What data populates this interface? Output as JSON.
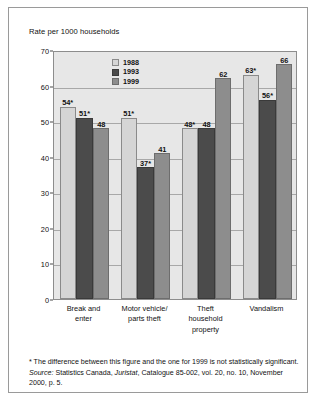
{
  "figure": {
    "axis_title": "Rate per 1000 households",
    "footnote": "* The difference between this figure and the one for 1999 is not statistically significant.",
    "source_prefix": "Source:",
    "source_text": " Statistics Canada, ",
    "source_italic_mid": "Juristat",
    "source_rest": ", Catalogue 85-002, vol. 20, no. 10, November 2000, p. 5."
  },
  "colors": {
    "s1988": "#d5d5d5",
    "s1993": "#4b4b4b",
    "s1999": "#8d8d8d",
    "plot_bg": "#e7e7e7",
    "grid": "#a8a8a8",
    "frame": "#9a9a9a"
  },
  "chart_data": {
    "type": "bar",
    "title": "",
    "xlabel": "",
    "ylabel": "Rate per 1000 households",
    "ylim": [
      0,
      70
    ],
    "yticks": [
      0,
      10,
      20,
      30,
      40,
      50,
      60,
      70
    ],
    "grid": true,
    "legend_position": "top-center",
    "categories": [
      "Break and enter",
      "Motor vehicle/ parts theft",
      "Theft household property",
      "Vandalism"
    ],
    "category_lines": [
      [
        "Break and",
        "enter"
      ],
      [
        "Motor vehicle/",
        "parts theft"
      ],
      [
        "Theft",
        "household",
        "property"
      ],
      [
        "Vandalism"
      ]
    ],
    "series": [
      {
        "name": "1988",
        "values": [
          54,
          51,
          48,
          63
        ],
        "labels": [
          "54*",
          "51*",
          "48*",
          "63*"
        ]
      },
      {
        "name": "1993",
        "values": [
          51,
          37,
          48,
          56
        ],
        "labels": [
          "51*",
          "37*",
          "48",
          "56*"
        ]
      },
      {
        "name": "1999",
        "values": [
          48,
          41,
          62,
          66
        ],
        "labels": [
          "48",
          "41",
          "62",
          "66"
        ]
      }
    ]
  }
}
